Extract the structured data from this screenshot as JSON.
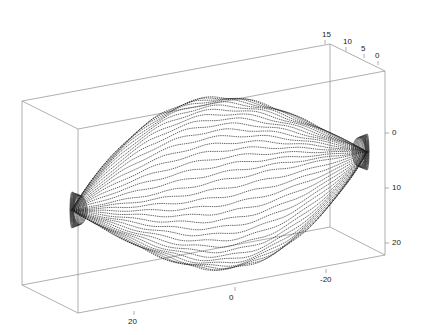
{
  "chart_data": {
    "type": "surface3d",
    "title": "",
    "style": "dotted mesh, black dots on white",
    "grid": false,
    "box": true,
    "axes": {
      "x": {
        "label": "",
        "ticks": [
          "20",
          "0",
          "-20"
        ],
        "range": [
          30,
          -30
        ]
      },
      "y": {
        "label": "",
        "ticks": [
          "15",
          "10",
          "5",
          "0"
        ],
        "range": [
          15,
          0
        ]
      },
      "z": {
        "label": "",
        "ticks": [
          "0",
          "10",
          "20"
        ],
        "range": [
          -5,
          22
        ]
      }
    },
    "shape": {
      "description": "spindle/lemon-shaped surface tapering to dense tips at both x ends, widest near x=0",
      "left_tip": [
        72,
        210
      ],
      "right_tip": [
        367,
        152
      ],
      "top_peak": [
        210,
        90
      ],
      "bottom_peak": [
        225,
        277
      ],
      "num_curves": 34
    },
    "colors": {
      "box": "#9a9a9a",
      "mesh": "#222222",
      "text": "#222222"
    }
  },
  "box": {
    "front": [
      [
        78,
        129
      ],
      [
        385,
        71
      ],
      [
        385,
        255
      ],
      [
        78,
        313
      ]
    ],
    "back": [
      [
        22,
        101
      ],
      [
        330,
        44
      ],
      [
        330,
        227
      ],
      [
        22,
        285
      ]
    ]
  },
  "tick_labels": {
    "x": [
      {
        "text": "20",
        "x": 128,
        "y": 318
      },
      {
        "text": "0",
        "x": 229,
        "y": 294
      },
      {
        "text": "-20",
        "x": 320,
        "y": 276
      }
    ],
    "y": [
      {
        "text": "15",
        "x": 322,
        "y": 31
      },
      {
        "text": "10",
        "x": 343,
        "y": 38
      },
      {
        "text": "5",
        "x": 361,
        "y": 45
      },
      {
        "text": "0",
        "x": 375,
        "y": 52
      }
    ],
    "z": [
      {
        "text": "0",
        "x": 392,
        "y": 129
      },
      {
        "text": "10",
        "x": 392,
        "y": 184
      },
      {
        "text": "20",
        "x": 392,
        "y": 239
      }
    ]
  }
}
